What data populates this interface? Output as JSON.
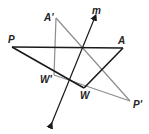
{
  "diagram": {
    "type": "reflection",
    "colors": {
      "original": "#1a1a1a",
      "image": "#8c8c8c",
      "mirror_line": "#1a1a1a"
    },
    "original_triangle": {
      "vertices": [
        {
          "label": "P",
          "x": 12,
          "y": 47
        },
        {
          "label": "A",
          "x": 123,
          "y": 48
        },
        {
          "label": "W",
          "x": 84,
          "y": 88
        }
      ]
    },
    "image_triangle": {
      "vertices": [
        {
          "label": "P'",
          "x": 130,
          "y": 101
        },
        {
          "label": "A'",
          "x": 56,
          "y": 18
        },
        {
          "label": "W'",
          "x": 54,
          "y": 75
        }
      ]
    },
    "mirror_line": {
      "label": "m",
      "start": {
        "x": 51,
        "y": 125
      },
      "end": {
        "x": 95,
        "y": 17
      }
    },
    "labels": {
      "P": "P",
      "A": "A",
      "W": "W",
      "P_prime": "P'",
      "A_prime": "A'",
      "W_prime": "W'",
      "m": "m"
    }
  }
}
